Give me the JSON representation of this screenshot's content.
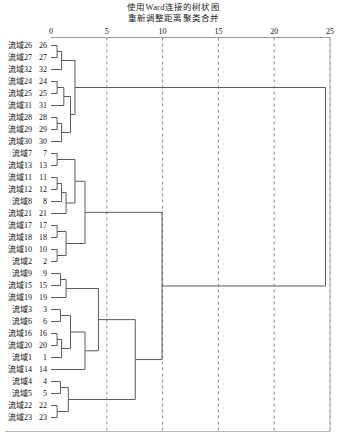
{
  "title": {
    "line1": "使用Ward连接的树状图",
    "line2": "重新调整距离聚类合并"
  },
  "axis": {
    "ticks": [
      "0",
      "5",
      "10",
      "15",
      "20",
      "25"
    ],
    "min": 0,
    "max": 25,
    "position": "top"
  },
  "leaves": [
    {
      "name": "流域26",
      "num": "26"
    },
    {
      "name": "流域27",
      "num": "27"
    },
    {
      "name": "流域32",
      "num": "32"
    },
    {
      "name": "流域24",
      "num": "24"
    },
    {
      "name": "流域25",
      "num": "25"
    },
    {
      "name": "流域31",
      "num": "31"
    },
    {
      "name": "流域28",
      "num": "28"
    },
    {
      "name": "流域29",
      "num": "29"
    },
    {
      "name": "流域30",
      "num": "30"
    },
    {
      "name": "流域7",
      "num": "7"
    },
    {
      "name": "流域13",
      "num": "13"
    },
    {
      "name": "流域11",
      "num": "11"
    },
    {
      "name": "流域12",
      "num": "12"
    },
    {
      "name": "流域8",
      "num": "8"
    },
    {
      "name": "流域21",
      "num": "21"
    },
    {
      "name": "流域17",
      "num": "17"
    },
    {
      "name": "流域18",
      "num": "18"
    },
    {
      "name": "流域10",
      "num": "10"
    },
    {
      "name": "流域2",
      "num": "2"
    },
    {
      "name": "流域9",
      "num": "9"
    },
    {
      "name": "流域15",
      "num": "15"
    },
    {
      "name": "流域19",
      "num": "19"
    },
    {
      "name": "流域3",
      "num": "3"
    },
    {
      "name": "流域6",
      "num": "6"
    },
    {
      "name": "流域16",
      "num": "16"
    },
    {
      "name": "流域20",
      "num": "20"
    },
    {
      "name": "流域1",
      "num": "1"
    },
    {
      "name": "流域14",
      "num": "14"
    },
    {
      "name": "流域4",
      "num": "4"
    },
    {
      "name": "流域5",
      "num": "5"
    },
    {
      "name": "流域22",
      "num": "22"
    },
    {
      "name": "流域23",
      "num": "23"
    }
  ],
  "chart_data": {
    "type": "dendrogram",
    "title": "使用Ward连接的树状图",
    "subtitle": "重新调整距离聚类合并",
    "xlabel": "",
    "ylabel": "",
    "xlim": [
      0,
      25
    ],
    "orientation": "horizontal",
    "grid": true,
    "leaf_order": [
      26,
      27,
      32,
      24,
      25,
      31,
      28,
      29,
      30,
      7,
      13,
      11,
      12,
      8,
      21,
      17,
      18,
      10,
      2,
      9,
      15,
      19,
      3,
      6,
      16,
      20,
      1,
      14,
      4,
      5,
      22,
      23
    ],
    "leaf_labels": [
      "流域26",
      "流域27",
      "流域32",
      "流域24",
      "流域25",
      "流域31",
      "流域28",
      "流域29",
      "流域30",
      "流域7",
      "流域13",
      "流域11",
      "流域12",
      "流域8",
      "流域21",
      "流域17",
      "流域18",
      "流域10",
      "流域2",
      "流域9",
      "流域15",
      "流域19",
      "流域3",
      "流域6",
      "流域16",
      "流域20",
      "流域1",
      "流域14",
      "流域4",
      "流域5",
      "流域22",
      "流域23"
    ],
    "merges": [
      {
        "id": "m1",
        "left": {
          "leaf": 0
        },
        "right": {
          "leaf": 1
        },
        "height": 0.55
      },
      {
        "id": "m2",
        "left": {
          "node": "m1"
        },
        "right": {
          "leaf": 2
        },
        "height": 0.95
      },
      {
        "id": "m3",
        "left": {
          "leaf": 3
        },
        "right": {
          "leaf": 4
        },
        "height": 0.55
      },
      {
        "id": "m4",
        "left": {
          "leaf": 6
        },
        "right": {
          "leaf": 7
        },
        "height": 0.55
      },
      {
        "id": "m5",
        "left": {
          "node": "m4"
        },
        "right": {
          "leaf": 8
        },
        "height": 0.95
      },
      {
        "id": "m6",
        "left": {
          "node": "m3"
        },
        "right": {
          "leaf": 5
        },
        "height": 1.15
      },
      {
        "id": "m7",
        "left": {
          "node": "m6"
        },
        "right": {
          "node": "m5"
        },
        "height": 1.75
      },
      {
        "id": "m8",
        "left": {
          "node": "m2"
        },
        "right": {
          "node": "m7"
        },
        "height": 2.15
      },
      {
        "id": "m9",
        "left": {
          "leaf": 9
        },
        "right": {
          "leaf": 10
        },
        "height": 0.55
      },
      {
        "id": "m10",
        "left": {
          "leaf": 11
        },
        "right": {
          "leaf": 12
        },
        "height": 0.55
      },
      {
        "id": "m11",
        "left": {
          "node": "m10"
        },
        "right": {
          "leaf": 13
        },
        "height": 0.95
      },
      {
        "id": "m12",
        "left": {
          "node": "m11"
        },
        "right": {
          "leaf": 14
        },
        "height": 1.35
      },
      {
        "id": "m13",
        "left": {
          "node": "m9"
        },
        "right": {
          "node": "m12"
        },
        "height": 2.15
      },
      {
        "id": "m14",
        "left": {
          "leaf": 15
        },
        "right": {
          "leaf": 16
        },
        "height": 0.55
      },
      {
        "id": "m15",
        "left": {
          "leaf": 17
        },
        "right": {
          "leaf": 18
        },
        "height": 0.55
      },
      {
        "id": "m16",
        "left": {
          "node": "m14"
        },
        "right": {
          "node": "m15"
        },
        "height": 1.35
      },
      {
        "id": "m17",
        "left": {
          "node": "m13"
        },
        "right": {
          "node": "m16"
        },
        "height": 3.05
      },
      {
        "id": "m18",
        "left": {
          "leaf": 19
        },
        "right": {
          "leaf": 20
        },
        "height": 0.85
      },
      {
        "id": "m19",
        "left": {
          "node": "m18"
        },
        "right": {
          "leaf": 21
        },
        "height": 1.35
      },
      {
        "id": "m20",
        "left": {
          "leaf": 22
        },
        "right": {
          "leaf": 23
        },
        "height": 0.85
      },
      {
        "id": "m21",
        "left": {
          "leaf": 24
        },
        "right": {
          "leaf": 25
        },
        "height": 0.55
      },
      {
        "id": "m22",
        "left": {
          "node": "m21"
        },
        "right": {
          "leaf": 26
        },
        "height": 0.95
      },
      {
        "id": "m23",
        "left": {
          "node": "m20"
        },
        "right": {
          "node": "m22"
        },
        "height": 1.75
      },
      {
        "id": "m24",
        "left": {
          "node": "m23"
        },
        "right": {
          "leaf": 27
        },
        "height": 3.05
      },
      {
        "id": "m25",
        "left": {
          "node": "m19"
        },
        "right": {
          "node": "m24"
        },
        "height": 4.25
      },
      {
        "id": "m26",
        "left": {
          "leaf": 28
        },
        "right": {
          "leaf": 29
        },
        "height": 0.85
      },
      {
        "id": "m27",
        "left": {
          "leaf": 30
        },
        "right": {
          "leaf": 31
        },
        "height": 0.55
      },
      {
        "id": "m28",
        "left": {
          "node": "m27"
        },
        "right": {
          "node": "m26"
        },
        "height": 1.55
      },
      {
        "id": "m29",
        "left": {
          "node": "m25"
        },
        "right": {
          "node": "m28"
        },
        "height": 7.55
      },
      {
        "id": "m30",
        "left": {
          "node": "m17"
        },
        "right": {
          "node": "m29"
        },
        "height": 9.95
      },
      {
        "id": "m31",
        "left": {
          "node": "m8"
        },
        "right": {
          "node": "m30"
        },
        "height": 24.6
      }
    ]
  }
}
